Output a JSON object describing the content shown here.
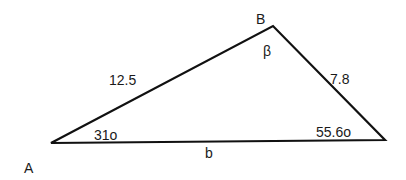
{
  "diagram": {
    "type": "triangle",
    "vertices": {
      "A": {
        "label": "A",
        "x": 51,
        "y": 143
      },
      "B": {
        "label": "B",
        "x": 273,
        "y": 26
      },
      "C": {
        "x": 385,
        "y": 140
      }
    },
    "sides": {
      "AB": "12.5",
      "BC": "7.8",
      "AC": "b"
    },
    "angles": {
      "A": "31o",
      "B": "β",
      "C": "55.6o"
    },
    "stroke_color": "#111111"
  }
}
